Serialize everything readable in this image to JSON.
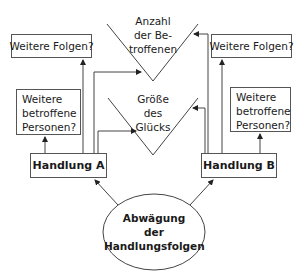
{
  "diagram": {
    "type": "flow",
    "colors": {
      "line": "#444444",
      "text": "#1a1a1a",
      "background": "#ffffff"
    },
    "criteria": {
      "top": {
        "lines": [
          "Anzahl",
          "der Be-",
          "troffenen"
        ]
      },
      "middle": {
        "lines": [
          "Größe",
          "des",
          "Glücks"
        ]
      }
    },
    "left": {
      "consequences": "Weitere Folgen?",
      "affected": {
        "lines": [
          "Weitere",
          "betroffene",
          "Personen?"
        ]
      },
      "action": "Handlung A"
    },
    "right": {
      "consequences": "Weitere Folgen?",
      "affected": {
        "lines": [
          "Weitere",
          "betroffene",
          "Personen?"
        ]
      },
      "action": "Handlung B"
    },
    "center": {
      "lines": [
        "Abwägung",
        "der",
        "Handlungsfolgen"
      ]
    }
  }
}
